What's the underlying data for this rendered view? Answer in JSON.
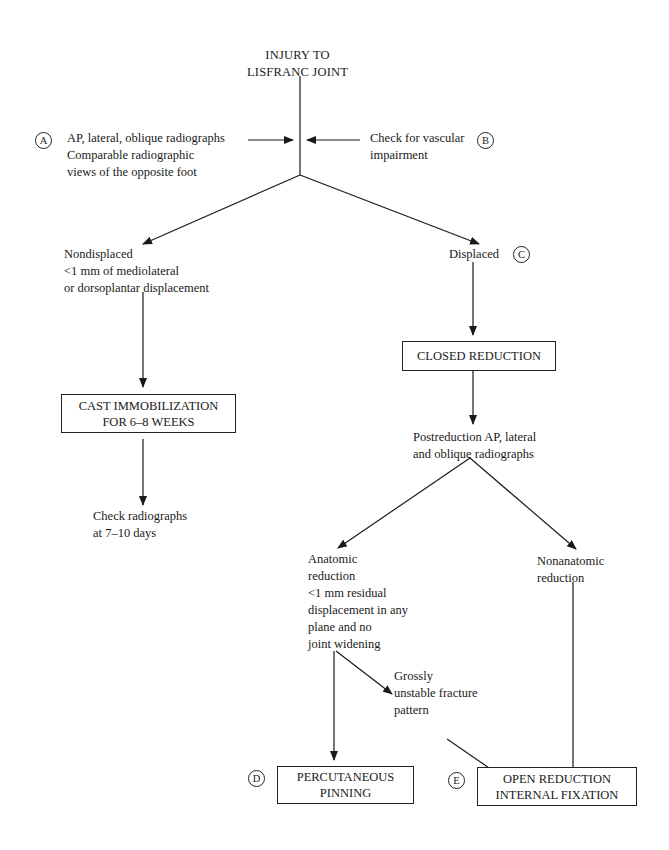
{
  "diagram": {
    "root": {
      "label": "INJURY TO\nLISFRANC JOINT"
    },
    "side_notes": [
      {
        "marker": "A",
        "text": "AP, lateral, oblique radiographs\nComparable radiographic\nviews of the opposite foot"
      },
      {
        "marker": "B",
        "text": "Check for vascular\nimpairment"
      }
    ],
    "nondisplaced": {
      "text": "Nondisplaced\n<1 mm of mediolateral\nor dorsoplantar displacement"
    },
    "displaced": {
      "text": "Displaced",
      "marker": "C"
    },
    "cast_box": {
      "label": "CAST IMMOBILIZATION\nFOR 6–8 WEEKS"
    },
    "check_radiographs": {
      "text": "Check radiographs\nat 7–10 days"
    },
    "closed_reduction_box": {
      "label": "CLOSED REDUCTION"
    },
    "postreduction": {
      "text": "Postreduction AP, lateral\nand oblique radiographs"
    },
    "anatomic": {
      "text": "Anatomic\nreduction\n<1 mm residual\ndisplacement in any\nplane and no\njoint widening"
    },
    "nonanatomic": {
      "text": "Nonanatomic\nreduction"
    },
    "grossly_unstable": {
      "text": "Grossly\nunstable fracture\npattern"
    },
    "percutaneous_box": {
      "label": "PERCUTANEOUS\nPINNING",
      "marker": "D"
    },
    "orif_box": {
      "label": "OPEN REDUCTION\nINTERNAL FIXATION",
      "marker": "E"
    }
  }
}
